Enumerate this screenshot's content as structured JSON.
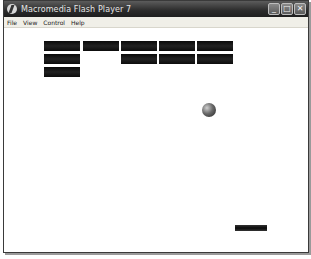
{
  "window": {
    "title": "Macromedia Flash Player 7",
    "controls": {
      "minimize": "_",
      "maximize": "□",
      "close": "✕"
    }
  },
  "menu": {
    "items": [
      "File",
      "View",
      "Control",
      "Help"
    ]
  },
  "game": {
    "type": "breakout",
    "bricks": [
      {
        "x": 44,
        "y": 41,
        "w": 36,
        "h": 10
      },
      {
        "x": 83,
        "y": 41,
        "w": 36,
        "h": 10
      },
      {
        "x": 121,
        "y": 41,
        "w": 36,
        "h": 10
      },
      {
        "x": 159,
        "y": 41,
        "w": 36,
        "h": 10
      },
      {
        "x": 197,
        "y": 41,
        "w": 36,
        "h": 10
      },
      {
        "x": 44,
        "y": 54,
        "w": 36,
        "h": 10
      },
      {
        "x": 121,
        "y": 54,
        "w": 36,
        "h": 10
      },
      {
        "x": 159,
        "y": 54,
        "w": 36,
        "h": 10
      },
      {
        "x": 197,
        "y": 54,
        "w": 36,
        "h": 10
      },
      {
        "x": 44,
        "y": 67,
        "w": 36,
        "h": 10
      }
    ],
    "ball": {
      "cx": 209,
      "cy": 110,
      "r": 7
    },
    "paddle": {
      "x": 235,
      "y": 225,
      "w": 32,
      "h": 6
    },
    "colors": {
      "brick": "#111111",
      "paddle": "#1a1a1a",
      "background": "#ffffff"
    }
  }
}
